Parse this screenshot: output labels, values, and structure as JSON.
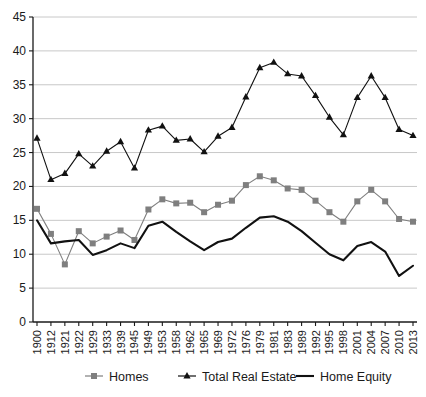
{
  "chart_data": {
    "type": "line",
    "title": "",
    "subtitle": "",
    "xlabel": "",
    "ylabel": "",
    "xlim": [
      0,
      27
    ],
    "ylim": [
      0,
      45
    ],
    "ytick_step": 5,
    "grid": true,
    "legend_position": "bottom",
    "categories": [
      "1900",
      "1912",
      "1921",
      "1922",
      "1929",
      "1933",
      "1939",
      "1945",
      "1949",
      "1953",
      "1958",
      "1962",
      "1965",
      "1969",
      "1972",
      "1976",
      "1979",
      "1981",
      "1983",
      "1989",
      "1992",
      "1995",
      "1998",
      "2001",
      "2004",
      "2007",
      "2010",
      "2013"
    ],
    "yticks": [
      "0",
      "5",
      "10",
      "15",
      "20",
      "25",
      "30",
      "35",
      "40",
      "45"
    ],
    "series": [
      {
        "name": "Homes",
        "marker": "square",
        "color": "#7f7f7f",
        "values": [
          16.7,
          13.0,
          8.5,
          13.4,
          11.6,
          12.6,
          13.5,
          12.1,
          16.6,
          18.1,
          17.5,
          17.6,
          16.2,
          17.3,
          17.9,
          20.2,
          21.5,
          20.9,
          19.7,
          19.5,
          17.9,
          16.2,
          14.8,
          17.8,
          19.5,
          17.8,
          15.2,
          14.8
        ]
      },
      {
        "name": "Total Real Estate",
        "marker": "triangle",
        "color": "#111111",
        "values": [
          27.1,
          21.0,
          21.9,
          24.8,
          23.0,
          25.2,
          26.6,
          22.7,
          28.3,
          28.9,
          26.8,
          27.0,
          25.1,
          27.4,
          28.7,
          33.2,
          37.5,
          38.3,
          36.6,
          36.3,
          33.4,
          30.2,
          27.6,
          33.1,
          36.3,
          33.1,
          28.4,
          27.5
        ]
      },
      {
        "name": "Home Equity",
        "marker": "none",
        "color": "#111111",
        "values": [
          15.0,
          11.6,
          11.9,
          12.1,
          9.9,
          10.6,
          11.6,
          10.9,
          14.2,
          14.8,
          13.3,
          11.9,
          10.6,
          11.8,
          12.3,
          13.9,
          15.4,
          15.6,
          14.8,
          13.4,
          11.7,
          10.0,
          9.1,
          11.2,
          11.8,
          10.4,
          6.8,
          8.3
        ]
      }
    ]
  },
  "legend": {
    "items": [
      {
        "label": "Homes",
        "marker": "square",
        "color": "#7f7f7f"
      },
      {
        "label": "Total Real Estate",
        "marker": "triangle",
        "color": "#111111"
      },
      {
        "label": "Home Equity",
        "marker": "line",
        "color": "#111111"
      }
    ]
  },
  "colors": {
    "homes": "#7f7f7f",
    "total_real_estate": "#111111",
    "home_equity": "#111111",
    "grid": "#c8c8c8",
    "axis": "#1a1a1a",
    "background": "#ffffff"
  }
}
